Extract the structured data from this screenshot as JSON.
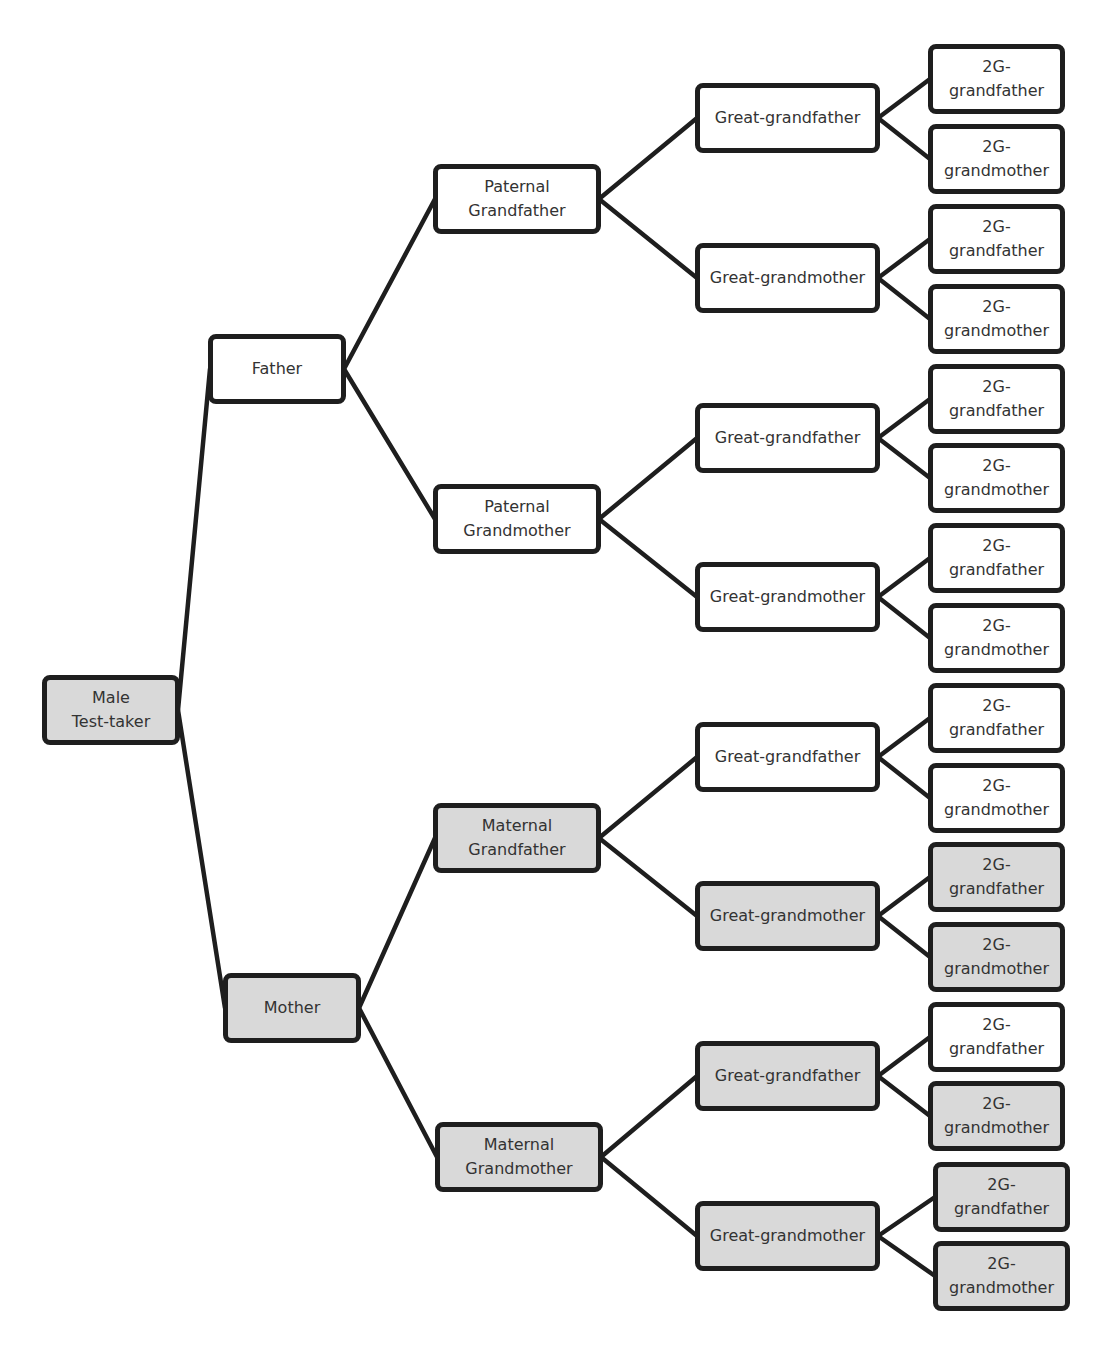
{
  "diagram": {
    "type": "pedigree-tree",
    "colors": {
      "shaded": "#d9d9d9",
      "unshaded": "#ffffff",
      "border": "#1e1e1e",
      "text": "#333333"
    },
    "nodes": [
      {
        "id": "root",
        "label": "Male\nTest-taker",
        "shaded": true,
        "x": 42,
        "y": 675,
        "w": 138,
        "h": 70
      },
      {
        "id": "father",
        "label": "Father",
        "shaded": false,
        "x": 208,
        "y": 334,
        "w": 138,
        "h": 70
      },
      {
        "id": "mother",
        "label": "Mother",
        "shaded": true,
        "x": 223,
        "y": 973,
        "w": 138,
        "h": 70
      },
      {
        "id": "pgf",
        "label": "Paternal\nGrandfather",
        "shaded": false,
        "x": 433,
        "y": 164,
        "w": 168,
        "h": 70
      },
      {
        "id": "pgm",
        "label": "Paternal\nGrandmother",
        "shaded": false,
        "x": 433,
        "y": 484,
        "w": 168,
        "h": 70
      },
      {
        "id": "mgf",
        "label": "Maternal\nGrandfather",
        "shaded": true,
        "x": 433,
        "y": 803,
        "w": 168,
        "h": 70
      },
      {
        "id": "mgm",
        "label": "Maternal\nGrandmother",
        "shaded": true,
        "x": 435,
        "y": 1122,
        "w": 168,
        "h": 70
      },
      {
        "id": "gg1",
        "label": "Great-grandfather",
        "shaded": false,
        "x": 695,
        "y": 83,
        "w": 185,
        "h": 70
      },
      {
        "id": "gg2",
        "label": "Great-grandmother",
        "shaded": false,
        "x": 695,
        "y": 243,
        "w": 185,
        "h": 70
      },
      {
        "id": "gg3",
        "label": "Great-grandfather",
        "shaded": false,
        "x": 695,
        "y": 403,
        "w": 185,
        "h": 70
      },
      {
        "id": "gg4",
        "label": "Great-grandmother",
        "shaded": false,
        "x": 695,
        "y": 562,
        "w": 185,
        "h": 70
      },
      {
        "id": "gg5",
        "label": "Great-grandfather",
        "shaded": false,
        "x": 695,
        "y": 722,
        "w": 185,
        "h": 70
      },
      {
        "id": "gg6",
        "label": "Great-grandmother",
        "shaded": true,
        "x": 695,
        "y": 881,
        "w": 185,
        "h": 70
      },
      {
        "id": "gg7",
        "label": "Great-grandfather",
        "shaded": true,
        "x": 695,
        "y": 1041,
        "w": 185,
        "h": 70
      },
      {
        "id": "gg8",
        "label": "Great-grandmother",
        "shaded": true,
        "x": 695,
        "y": 1201,
        "w": 185,
        "h": 70
      },
      {
        "id": "g2_1",
        "label": "2G-\ngrandfather",
        "shaded": false,
        "x": 928,
        "y": 44,
        "w": 137,
        "h": 70
      },
      {
        "id": "g2_2",
        "label": "2G-\ngrandmother",
        "shaded": false,
        "x": 928,
        "y": 124,
        "w": 137,
        "h": 70
      },
      {
        "id": "g2_3",
        "label": "2G-\ngrandfather",
        "shaded": false,
        "x": 928,
        "y": 204,
        "w": 137,
        "h": 70
      },
      {
        "id": "g2_4",
        "label": "2G-\ngrandmother",
        "shaded": false,
        "x": 928,
        "y": 284,
        "w": 137,
        "h": 70
      },
      {
        "id": "g2_5",
        "label": "2G-\ngrandfather",
        "shaded": false,
        "x": 928,
        "y": 364,
        "w": 137,
        "h": 70
      },
      {
        "id": "g2_6",
        "label": "2G-\ngrandmother",
        "shaded": false,
        "x": 928,
        "y": 443,
        "w": 137,
        "h": 70
      },
      {
        "id": "g2_7",
        "label": "2G-\ngrandfather",
        "shaded": false,
        "x": 928,
        "y": 523,
        "w": 137,
        "h": 70
      },
      {
        "id": "g2_8",
        "label": "2G-\ngrandmother",
        "shaded": false,
        "x": 928,
        "y": 603,
        "w": 137,
        "h": 70
      },
      {
        "id": "g2_9",
        "label": "2G-\ngrandfather",
        "shaded": false,
        "x": 928,
        "y": 683,
        "w": 137,
        "h": 70
      },
      {
        "id": "g2_10",
        "label": "2G-\ngrandmother",
        "shaded": false,
        "x": 928,
        "y": 763,
        "w": 137,
        "h": 70
      },
      {
        "id": "g2_11",
        "label": "2G-\ngrandfather",
        "shaded": true,
        "x": 928,
        "y": 842,
        "w": 137,
        "h": 70
      },
      {
        "id": "g2_12",
        "label": "2G-\ngrandmother",
        "shaded": true,
        "x": 928,
        "y": 922,
        "w": 137,
        "h": 70
      },
      {
        "id": "g2_13",
        "label": "2G-\ngrandfather",
        "shaded": false,
        "x": 928,
        "y": 1002,
        "w": 137,
        "h": 70
      },
      {
        "id": "g2_14",
        "label": "2G-\ngrandmother",
        "shaded": true,
        "x": 928,
        "y": 1081,
        "w": 137,
        "h": 70
      },
      {
        "id": "g2_15",
        "label": "2G-\ngrandfather",
        "shaded": true,
        "x": 933,
        "y": 1162,
        "w": 137,
        "h": 70
      },
      {
        "id": "g2_16",
        "label": "2G-\ngrandmother",
        "shaded": true,
        "x": 933,
        "y": 1241,
        "w": 137,
        "h": 70
      }
    ],
    "edges": [
      [
        "root",
        "father"
      ],
      [
        "root",
        "mother"
      ],
      [
        "father",
        "pgf"
      ],
      [
        "father",
        "pgm"
      ],
      [
        "mother",
        "mgf"
      ],
      [
        "mother",
        "mgm"
      ],
      [
        "pgf",
        "gg1"
      ],
      [
        "pgf",
        "gg2"
      ],
      [
        "pgm",
        "gg3"
      ],
      [
        "pgm",
        "gg4"
      ],
      [
        "mgf",
        "gg5"
      ],
      [
        "mgf",
        "gg6"
      ],
      [
        "mgm",
        "gg7"
      ],
      [
        "mgm",
        "gg8"
      ],
      [
        "gg1",
        "g2_1"
      ],
      [
        "gg1",
        "g2_2"
      ],
      [
        "gg2",
        "g2_3"
      ],
      [
        "gg2",
        "g2_4"
      ],
      [
        "gg3",
        "g2_5"
      ],
      [
        "gg3",
        "g2_6"
      ],
      [
        "gg4",
        "g2_7"
      ],
      [
        "gg4",
        "g2_8"
      ],
      [
        "gg5",
        "g2_9"
      ],
      [
        "gg5",
        "g2_10"
      ],
      [
        "gg6",
        "g2_11"
      ],
      [
        "gg6",
        "g2_12"
      ],
      [
        "gg7",
        "g2_13"
      ],
      [
        "gg7",
        "g2_14"
      ],
      [
        "gg8",
        "g2_15"
      ],
      [
        "gg8",
        "g2_16"
      ]
    ]
  }
}
